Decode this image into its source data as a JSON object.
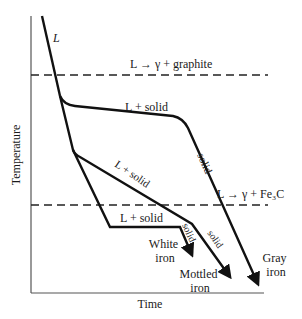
{
  "diagram": {
    "type": "cooling-curves",
    "axes": {
      "x_label": "Time",
      "y_label": "Temperature"
    },
    "reference_lines": [
      {
        "id": "graphite-eutectic",
        "label": "L → γ + graphite",
        "style": "dashed"
      },
      {
        "id": "cementite-eutectic",
        "label": "L → γ + Fe₃C",
        "style": "dashed"
      }
    ],
    "curve_labels": {
      "liquid": "L",
      "gray_plateau": "L + solid",
      "gray_solid": "solid",
      "mottled_slope": "L + solid",
      "mottled_solid": "solid",
      "white_plateau": "L + solid",
      "white_solid": "solid"
    },
    "end_labels": {
      "white": [
        "White",
        "iron"
      ],
      "mottled": [
        "Mottled",
        "iron"
      ],
      "gray": [
        "Gray",
        "iron"
      ]
    },
    "colors": {
      "line": "#111111",
      "background": "#ffffff"
    }
  }
}
